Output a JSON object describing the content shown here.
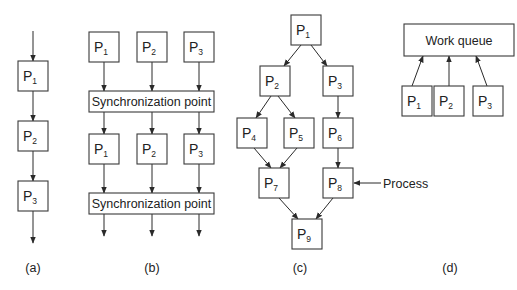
{
  "figure": {
    "panels": [
      {
        "id": "a",
        "caption": "(a)",
        "nodes": [
          {
            "id": "a_p1",
            "label": "P",
            "sub": "1",
            "x": 18,
            "y": 61,
            "w": 30,
            "h": 30
          },
          {
            "id": "a_p2",
            "label": "P",
            "sub": "2",
            "x": 18,
            "y": 121,
            "w": 30,
            "h": 30
          },
          {
            "id": "a_p3",
            "label": "P",
            "sub": "3",
            "x": 18,
            "y": 181,
            "w": 30,
            "h": 30
          }
        ],
        "edges": [
          {
            "x1": 33,
            "y1": 31,
            "x2": 33,
            "y2": 61
          },
          {
            "x1": 33,
            "y1": 91,
            "x2": 33,
            "y2": 121
          },
          {
            "x1": 33,
            "y1": 151,
            "x2": 33,
            "y2": 181
          },
          {
            "x1": 33,
            "y1": 211,
            "x2": 33,
            "y2": 243
          }
        ],
        "caption_pos": {
          "x": 33,
          "y": 272
        }
      },
      {
        "id": "b",
        "caption": "(b)",
        "nodes": [
          {
            "id": "b_p1_top",
            "label": "P",
            "sub": "1",
            "x": 89,
            "y": 32,
            "w": 30,
            "h": 30
          },
          {
            "id": "b_p2_top",
            "label": "P",
            "sub": "2",
            "x": 137,
            "y": 32,
            "w": 30,
            "h": 30
          },
          {
            "id": "b_p3_top",
            "label": "P",
            "sub": "3",
            "x": 184,
            "y": 32,
            "w": 30,
            "h": 30
          },
          {
            "id": "b_p1_mid",
            "label": "P",
            "sub": "1",
            "x": 89,
            "y": 134,
            "w": 30,
            "h": 30
          },
          {
            "id": "b_p2_mid",
            "label": "P",
            "sub": "2",
            "x": 137,
            "y": 134,
            "w": 30,
            "h": 30
          },
          {
            "id": "b_p3_mid",
            "label": "P",
            "sub": "3",
            "x": 184,
            "y": 134,
            "w": 30,
            "h": 30
          }
        ],
        "bars": [
          {
            "id": "b_sync1",
            "label": "Synchronization point",
            "x": 89,
            "y": 91,
            "w": 125,
            "h": 21
          },
          {
            "id": "b_sync2",
            "label": "Synchronization point",
            "x": 89,
            "y": 193,
            "w": 125,
            "h": 21
          }
        ],
        "edges": [
          {
            "x1": 104,
            "y1": 62,
            "x2": 104,
            "y2": 91
          },
          {
            "x1": 152,
            "y1": 62,
            "x2": 152,
            "y2": 91
          },
          {
            "x1": 199,
            "y1": 62,
            "x2": 199,
            "y2": 91
          },
          {
            "x1": 104,
            "y1": 112,
            "x2": 104,
            "y2": 134
          },
          {
            "x1": 152,
            "y1": 112,
            "x2": 152,
            "y2": 134
          },
          {
            "x1": 199,
            "y1": 112,
            "x2": 199,
            "y2": 134
          },
          {
            "x1": 104,
            "y1": 164,
            "x2": 104,
            "y2": 193
          },
          {
            "x1": 152,
            "y1": 164,
            "x2": 152,
            "y2": 193
          },
          {
            "x1": 199,
            "y1": 164,
            "x2": 199,
            "y2": 193
          },
          {
            "x1": 104,
            "y1": 214,
            "x2": 104,
            "y2": 236
          },
          {
            "x1": 152,
            "y1": 214,
            "x2": 152,
            "y2": 236
          },
          {
            "x1": 199,
            "y1": 214,
            "x2": 199,
            "y2": 236
          }
        ],
        "caption_pos": {
          "x": 152,
          "y": 272
        }
      },
      {
        "id": "c",
        "caption": "(c)",
        "nodes": [
          {
            "id": "c_p1",
            "label": "P",
            "sub": "1",
            "x": 291,
            "y": 15,
            "w": 30,
            "h": 30
          },
          {
            "id": "c_p2",
            "label": "P",
            "sub": "2",
            "x": 260,
            "y": 66,
            "w": 30,
            "h": 30
          },
          {
            "id": "c_p3",
            "label": "P",
            "sub": "3",
            "x": 323,
            "y": 66,
            "w": 30,
            "h": 30
          },
          {
            "id": "c_p4",
            "label": "P",
            "sub": "4",
            "x": 237,
            "y": 118,
            "w": 30,
            "h": 30
          },
          {
            "id": "c_p5",
            "label": "P",
            "sub": "5",
            "x": 284,
            "y": 118,
            "w": 30,
            "h": 30
          },
          {
            "id": "c_p6",
            "label": "P",
            "sub": "6",
            "x": 323,
            "y": 118,
            "w": 30,
            "h": 30
          },
          {
            "id": "c_p7",
            "label": "P",
            "sub": "7",
            "x": 259,
            "y": 168,
            "w": 30,
            "h": 30
          },
          {
            "id": "c_p8",
            "label": "P",
            "sub": "8",
            "x": 323,
            "y": 168,
            "w": 30,
            "h": 30
          },
          {
            "id": "c_p9",
            "label": "P",
            "sub": "9",
            "x": 292,
            "y": 219,
            "w": 30,
            "h": 30
          }
        ],
        "edges": [
          {
            "x1": 301,
            "y1": 45,
            "x2": 284,
            "y2": 66
          },
          {
            "x1": 311,
            "y1": 45,
            "x2": 327,
            "y2": 66
          },
          {
            "x1": 271,
            "y1": 96,
            "x2": 256,
            "y2": 118
          },
          {
            "x1": 278,
            "y1": 96,
            "x2": 295,
            "y2": 118
          },
          {
            "x1": 338,
            "y1": 96,
            "x2": 338,
            "y2": 118
          },
          {
            "x1": 254,
            "y1": 148,
            "x2": 271,
            "y2": 168
          },
          {
            "x1": 297,
            "y1": 148,
            "x2": 280,
            "y2": 168
          },
          {
            "x1": 338,
            "y1": 148,
            "x2": 338,
            "y2": 168
          },
          {
            "x1": 279,
            "y1": 198,
            "x2": 298,
            "y2": 219
          },
          {
            "x1": 333,
            "y1": 198,
            "x2": 316,
            "y2": 219
          },
          {
            "x1": 381,
            "y1": 183,
            "x2": 354,
            "y2": 183
          }
        ],
        "annotation": {
          "text": "Process",
          "x": 383,
          "y": 188
        },
        "caption_pos": {
          "x": 300,
          "y": 272
        }
      },
      {
        "id": "d",
        "caption": "(d)",
        "bars": [
          {
            "id": "d_queue",
            "label": "Work queue",
            "x": 404,
            "y": 24,
            "w": 110,
            "h": 32
          }
        ],
        "nodes": [
          {
            "id": "d_p1",
            "label": "P",
            "sub": "1",
            "x": 402,
            "y": 86,
            "w": 30,
            "h": 30
          },
          {
            "id": "d_p2",
            "label": "P",
            "sub": "2",
            "x": 434,
            "y": 86,
            "w": 30,
            "h": 30
          },
          {
            "id": "d_p3",
            "label": "P",
            "sub": "3",
            "x": 473,
            "y": 86,
            "w": 30,
            "h": 30
          }
        ],
        "edges": [
          {
            "x1": 412,
            "y1": 86,
            "x2": 423,
            "y2": 56
          },
          {
            "x1": 449,
            "y1": 86,
            "x2": 449,
            "y2": 56
          },
          {
            "x1": 487,
            "y1": 86,
            "x2": 476,
            "y2": 56
          }
        ],
        "caption_pos": {
          "x": 450,
          "y": 272
        }
      }
    ]
  }
}
